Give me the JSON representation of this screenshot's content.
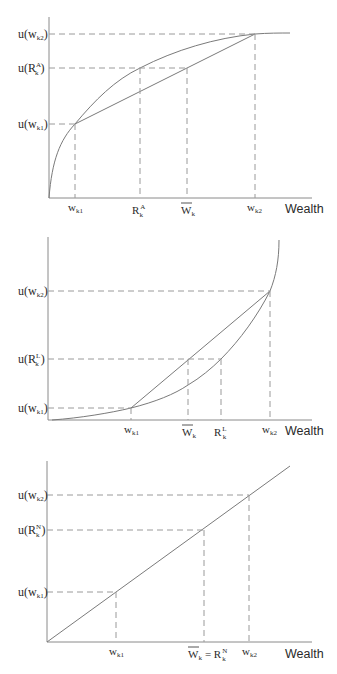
{
  "figure": {
    "axis_label_x": "Wealth",
    "panels": [
      {
        "name": "risk-averse",
        "curve_type": "concave",
        "y_labels": {
          "u_wk2": {
            "base": "u(w",
            "sub": "k2",
            "close": ")"
          },
          "u_R": {
            "base": "u(R",
            "sup": "A",
            "sub": "k",
            "close": ")"
          },
          "u_wk1": {
            "base": "u(w",
            "sub": "k1",
            "close": ")"
          }
        },
        "x_labels": {
          "wk1": {
            "base": "w",
            "sub": "k1"
          },
          "R": {
            "base": "R",
            "sup": "A",
            "sub": "k"
          },
          "W": {
            "base": "W",
            "sub": "k",
            "overline": true
          },
          "wk2": {
            "base": "w",
            "sub": "k2"
          }
        }
      },
      {
        "name": "risk-lover",
        "curve_type": "convex",
        "y_labels": {
          "u_wk2": {
            "base": "u(w",
            "sub": "k2",
            "close": ")"
          },
          "u_R": {
            "base": "u(R",
            "sup": "L",
            "sub": "k",
            "close": ")"
          },
          "u_wk1": {
            "base": "u(w",
            "sub": "k1",
            "close": ")"
          }
        },
        "x_labels": {
          "wk1": {
            "base": "w",
            "sub": "k1"
          },
          "W": {
            "base": "W",
            "sub": "k",
            "overline": true
          },
          "R": {
            "base": "R",
            "sup": "L",
            "sub": "k"
          },
          "wk2": {
            "base": "w",
            "sub": "k2"
          }
        }
      },
      {
        "name": "risk-neutral",
        "curve_type": "linear",
        "y_labels": {
          "u_wk2": {
            "base": "u(w",
            "sub": "k2",
            "close": ")"
          },
          "u_R": {
            "base": "u(R",
            "sup": "N",
            "sub": "k",
            "close": ")"
          },
          "u_wk1": {
            "base": "u(w",
            "sub": "k1",
            "close": ")"
          }
        },
        "x_labels": {
          "wk1": {
            "base": "w",
            "sub": "k1"
          },
          "W_eq_R": {
            "base": "W",
            "sub": "k",
            "overline": true,
            "eq": "= R",
            "sup": "N",
            "sub2": "k"
          },
          "wk2": {
            "base": "w",
            "sub": "k2"
          }
        }
      }
    ]
  }
}
